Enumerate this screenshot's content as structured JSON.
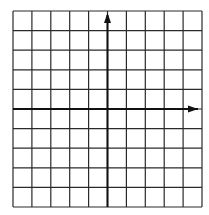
{
  "diagram": {
    "type": "coordinate-plane",
    "columns": 10,
    "rows": 10,
    "grid": {
      "left": 13,
      "top": 11,
      "right": 202,
      "bottom": 207
    },
    "y_axis": {
      "column_index": 5,
      "arrow": "up"
    },
    "x_axis": {
      "row_index": 5,
      "arrow": "right"
    },
    "colors": {
      "grid_line": "#2a2a2a",
      "axis": "#111111",
      "background": "#ffffff"
    }
  }
}
